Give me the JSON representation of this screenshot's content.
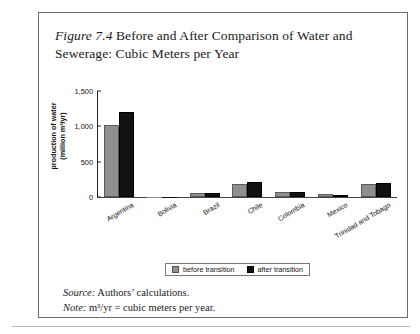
{
  "figure": {
    "number_label": "Figure 7.4",
    "title_text": " Before and After Comparison of Water and Sewerage: Cubic Meters per Year",
    "source_lead": "Source:",
    "source_text": " Authors’ calculations.",
    "note_lead": "Note:",
    "note_text": " m³/yr = cubic meters per year."
  },
  "legend": {
    "before_label": "before transition",
    "after_label": "after transition",
    "before_color": "#8f8f8f",
    "after_color": "#121212"
  },
  "axis": {
    "y_title_line1": "production of water",
    "y_title_line2": "(million m³/yr)",
    "ticks": [
      "1,500",
      "1,000",
      "500",
      "0"
    ]
  },
  "chart_data": {
    "type": "bar",
    "title": "Figure 7.4 Before and After Comparison of Water and Sewerage: Cubic Meters per Year",
    "xlabel": "",
    "ylabel": "production of water (million m³/yr)",
    "ylim": [
      0,
      1500
    ],
    "yticks": [
      0,
      500,
      1000,
      1500
    ],
    "grid": false,
    "legend_position": "bottom-center",
    "categories": [
      "Argentina",
      "Bolivia",
      "Brazil",
      "Chile",
      "Colombia",
      "Mexico",
      "Trinidad and Tobago"
    ],
    "series": [
      {
        "name": "before transition",
        "color": "#8f8f8f",
        "values": [
          1020,
          5,
          55,
          190,
          70,
          40,
          180
        ]
      },
      {
        "name": "after transition",
        "color": "#121212",
        "values": [
          1200,
          5,
          50,
          215,
          65,
          35,
          205
        ]
      }
    ]
  }
}
